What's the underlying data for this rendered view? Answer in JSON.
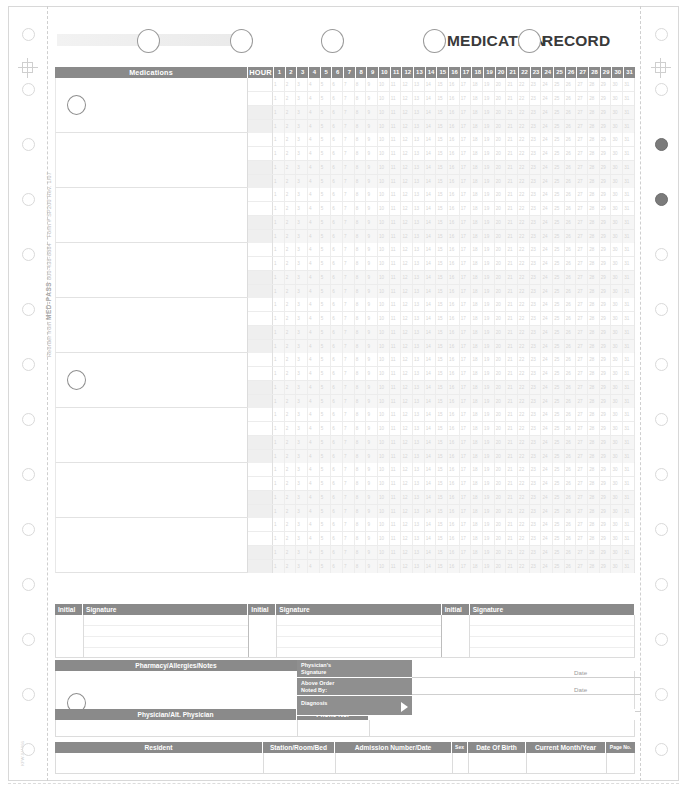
{
  "form": {
    "title_part1": "MEDICATION",
    "title_part2": "RECORD",
    "reorder_text": "Reorder from",
    "brand": "MED-PASS",
    "phone": "800-438-8884",
    "form_number": "Form # SP200",
    "revision": "Rev. 1/07",
    "bottom_code": "KFW-041066"
  },
  "grid": {
    "col_medications": "Medications",
    "col_hour": "HOUR",
    "days": [
      "1",
      "2",
      "3",
      "4",
      "5",
      "6",
      "7",
      "8",
      "9",
      "10",
      "11",
      "12",
      "13",
      "14",
      "15",
      "16",
      "17",
      "18",
      "19",
      "20",
      "21",
      "22",
      "23",
      "24",
      "25",
      "26",
      "27",
      "28",
      "29",
      "30",
      "31"
    ],
    "num_med_blocks": 9,
    "sub_rows_per_block": 4,
    "blocks_with_hole": [
      0,
      5
    ]
  },
  "signature_section": {
    "columns": [
      {
        "initial": "Initial",
        "signature": "Signature"
      },
      {
        "initial": "Initial",
        "signature": "Signature"
      },
      {
        "initial": "Initial",
        "signature": "Signature"
      }
    ]
  },
  "pharmacy_section": {
    "header": "Pharmacy/Allergies/Notes",
    "physician_labels": [
      "Physician's\nSignature",
      "Above Order\nNoted By:",
      "Diagnosis"
    ],
    "physician_signature_label_line1": "Physician's",
    "physician_signature_label_line2": "Signature",
    "above_order_label_line1": "Above Order",
    "above_order_label_line2": "Noted By:",
    "diagnosis_label": "Diagnosis",
    "date_label_1": "Date",
    "date_label_2": "Date"
  },
  "physician_row": {
    "col_physician": "Physician/Alt. Physician",
    "col_phone": "Phone No."
  },
  "resident_row": {
    "col_resident": "Resident",
    "col_station": "Station/Room/Bed",
    "col_admission": "Admission Number/Date",
    "col_sex": "Sex",
    "col_dob": "Date Of Birth",
    "col_month_year": "Current Month/Year",
    "col_page": "Page No."
  },
  "colors": {
    "header_bar": "#8a8a8a",
    "grid_line": "#e2e2e2",
    "text_on_bar": "#ffffff",
    "paper": "#ffffff",
    "hole_stroke": "#d9d9d9",
    "hole_filled": "#7b7b7b"
  },
  "header_circles": {
    "count": 5,
    "positions": [
      96,
      188,
      280,
      380,
      474
    ]
  },
  "tractor": {
    "left_holes": 14,
    "right_holes": 14,
    "filled_right_indices": [
      2,
      3
    ]
  }
}
